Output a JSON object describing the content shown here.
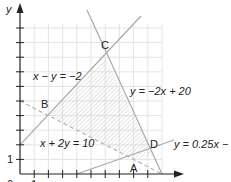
{
  "diagram": {
    "type": "linear-programming-feasible-region",
    "axes": {
      "x_label": "x",
      "y_label": "y",
      "origin_label": "0",
      "tick_label_y": "1",
      "tick_label_x": "1",
      "x_range": [
        0,
        10
      ],
      "y_range": [
        0,
        10
      ],
      "grid": true
    },
    "lines": [
      {
        "id": "l1",
        "label": "x − y = −2",
        "style": "solid",
        "slope": 1,
        "intercept": 2
      },
      {
        "id": "l2",
        "label": "y = −2x + 20",
        "style": "solid",
        "slope": -2,
        "intercept": 20
      },
      {
        "id": "l3",
        "label": "x + 2y = 10",
        "style": "dashed",
        "slope": -0.5,
        "intercept": 5
      },
      {
        "id": "l4",
        "label": "y = 0.25x − 1",
        "style": "solid",
        "slope": 0.25,
        "intercept": -1
      }
    ],
    "vertices": [
      {
        "name": "A",
        "x": 8,
        "y": 1
      },
      {
        "name": "B",
        "x": 2,
        "y": 4
      },
      {
        "name": "C",
        "x": 6,
        "y": 8
      },
      {
        "name": "D",
        "x": 9.33,
        "y": 1.33
      }
    ],
    "feasible_region": "hatched polygon B-C-D-A",
    "colors": {
      "line": "#a8a8a8",
      "grid": "#e4e4e4",
      "axis": "#222222",
      "hatch": "#c8c8c8",
      "text": "#222222"
    }
  }
}
